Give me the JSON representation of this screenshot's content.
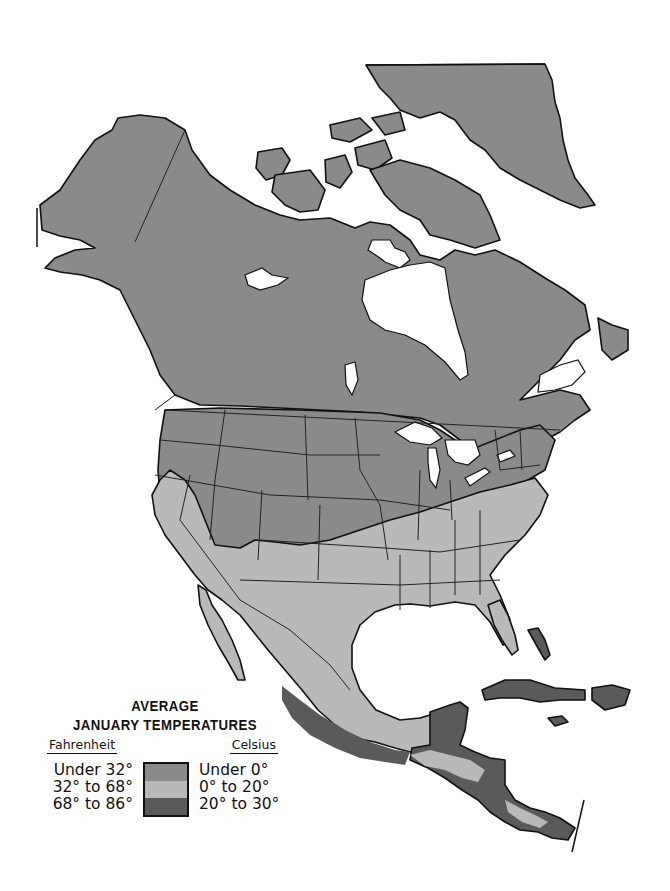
{
  "map": {
    "title_line1": "AVERAGE",
    "title_line2": "JANUARY TEMPERATURES",
    "region": "North America",
    "colors": {
      "cold": "#8a8a8a",
      "mild": "#b9b9b9",
      "warm": "#5a5a5a",
      "water": "#ffffff",
      "outline": "#111111"
    }
  },
  "legend": {
    "fahrenheit_header": "Fahrenheit",
    "celsius_header": "Celsius",
    "items": [
      {
        "fahrenheit": "Under 32°",
        "celsius": "Under 0°",
        "color": "#8a8a8a"
      },
      {
        "fahrenheit": "32° to 68°",
        "celsius": "0° to 20°",
        "color": "#b9b9b9"
      },
      {
        "fahrenheit": "68° to 86°",
        "celsius": "20° to 30°",
        "color": "#5a5a5a"
      }
    ]
  }
}
